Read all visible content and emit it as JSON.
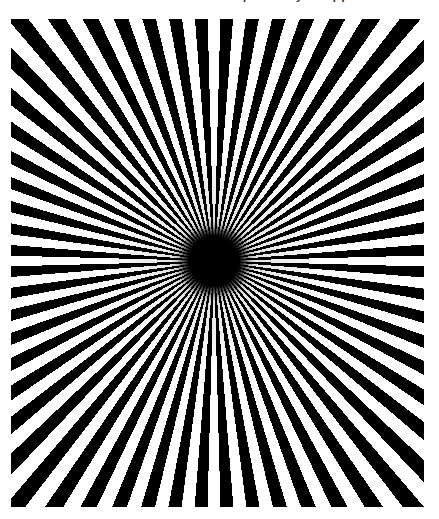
{
  "page": {
    "width": 439,
    "height": 519,
    "background_color": "#ffffff",
    "top_text_remnant": "partially cropped text line",
    "caption": ""
  },
  "figure": {
    "name": "radial-starburst-illusion",
    "title": "",
    "frame": {
      "x": 11,
      "y": 19,
      "width": 413,
      "height": 488
    },
    "ink_color": "#000000",
    "paper_color": "#ffffff",
    "vanishing_point": {
      "x": 214,
      "y": 261
    },
    "core_radius_px": 26,
    "ray_count": 60,
    "sector_count": 120,
    "duty_cycle_percent": 50,
    "start_angle_deg": 1.5
  },
  "chart_data": {
    "type": "pie",
    "xlabel": "",
    "ylabel": "",
    "legend": [],
    "categories": [
      "black ray",
      "white gap",
      "black ray",
      "white gap",
      "black ray",
      "white gap",
      "black ray",
      "white gap",
      "black ray",
      "white gap",
      "black ray",
      "white gap",
      "black ray",
      "white gap",
      "black ray",
      "white gap",
      "black ray",
      "white gap",
      "black ray",
      "white gap",
      "black ray",
      "white gap",
      "black ray",
      "white gap",
      "black ray",
      "white gap",
      "black ray",
      "white gap",
      "black ray",
      "white gap",
      "black ray",
      "white gap",
      "black ray",
      "white gap",
      "black ray",
      "white gap",
      "black ray",
      "white gap",
      "black ray",
      "white gap",
      "black ray",
      "white gap",
      "black ray",
      "white gap",
      "black ray",
      "white gap",
      "black ray",
      "white gap",
      "black ray",
      "white gap",
      "black ray",
      "white gap",
      "black ray",
      "white gap",
      "black ray",
      "white gap",
      "black ray",
      "white gap",
      "black ray",
      "white gap",
      "black ray",
      "white gap",
      "black ray",
      "white gap",
      "black ray",
      "white gap",
      "black ray",
      "white gap",
      "black ray",
      "white gap",
      "black ray",
      "white gap",
      "black ray",
      "white gap",
      "black ray",
      "white gap",
      "black ray",
      "white gap",
      "black ray",
      "white gap",
      "black ray",
      "white gap",
      "black ray",
      "white gap",
      "black ray",
      "white gap",
      "black ray",
      "white gap",
      "black ray",
      "white gap",
      "black ray",
      "white gap",
      "black ray",
      "white gap",
      "black ray",
      "white gap",
      "black ray",
      "white gap",
      "black ray",
      "white gap",
      "black ray",
      "white gap",
      "black ray",
      "white gap",
      "black ray",
      "white gap",
      "black ray",
      "white gap",
      "black ray",
      "white gap",
      "black ray",
      "white gap",
      "black ray",
      "white gap",
      "black ray",
      "white gap",
      "black ray",
      "white gap",
      "black ray",
      "white gap"
    ],
    "values": [
      3,
      3,
      3,
      3,
      3,
      3,
      3,
      3,
      3,
      3,
      3,
      3,
      3,
      3,
      3,
      3,
      3,
      3,
      3,
      3,
      3,
      3,
      3,
      3,
      3,
      3,
      3,
      3,
      3,
      3,
      3,
      3,
      3,
      3,
      3,
      3,
      3,
      3,
      3,
      3,
      3,
      3,
      3,
      3,
      3,
      3,
      3,
      3,
      3,
      3,
      3,
      3,
      3,
      3,
      3,
      3,
      3,
      3,
      3,
      3,
      3,
      3,
      3,
      3,
      3,
      3,
      3,
      3,
      3,
      3,
      3,
      3,
      3,
      3,
      3,
      3,
      3,
      3,
      3,
      3,
      3,
      3,
      3,
      3,
      3,
      3,
      3,
      3,
      3,
      3,
      3,
      3,
      3,
      3,
      3,
      3,
      3,
      3,
      3,
      3,
      3,
      3,
      3,
      3,
      3,
      3,
      3,
      3,
      3,
      3,
      3,
      3,
      3,
      3,
      3,
      3,
      3,
      3,
      3,
      3
    ],
    "slice_angle_deg": 3,
    "colors": [
      "#000000",
      "#ffffff"
    ],
    "annotations": []
  }
}
